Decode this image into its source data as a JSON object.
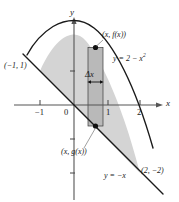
{
  "figure": {
    "kind": "calculus-area-between-curves-diagram",
    "axes": {
      "x_axis_label": "x",
      "y_axis_label": "y",
      "x_ticks": [
        {
          "value": -1,
          "label": "−1"
        },
        {
          "value": 0,
          "label": "0"
        },
        {
          "value": 1,
          "label": "1"
        },
        {
          "value": 2,
          "label": "2"
        }
      ],
      "y_ticks": [
        {
          "value": 1,
          "label": ""
        },
        {
          "value": -1,
          "label": ""
        },
        {
          "value": -2,
          "label": ""
        }
      ],
      "xlim": [
        -1.9,
        2.7
      ],
      "ylim": [
        -2.9,
        2.6
      ]
    },
    "curves": [
      {
        "name": "parabola",
        "equation_label": "y = 2 − x",
        "equation_exponent": "2",
        "function": "2 - x^2"
      },
      {
        "name": "line",
        "equation_label": "y = −x",
        "equation_exponent": "",
        "function": "-x"
      }
    ],
    "intersections": [
      {
        "label": "(−1, 1)",
        "x": -1,
        "y": 1
      },
      {
        "label": "(2, −2)",
        "x": 2,
        "y": -2
      }
    ],
    "rectangle": {
      "top_point_label": "(x, f(x))",
      "bottom_point_label": "(x, g(x))",
      "width_label": "Δx",
      "x_left": 0.42,
      "x_right": 0.88
    },
    "colors": {
      "region_fill": "#d4d4d4",
      "rect_fill": "#b9b9b9",
      "stroke": "#1a1a1a",
      "background": "#ffffff"
    }
  }
}
